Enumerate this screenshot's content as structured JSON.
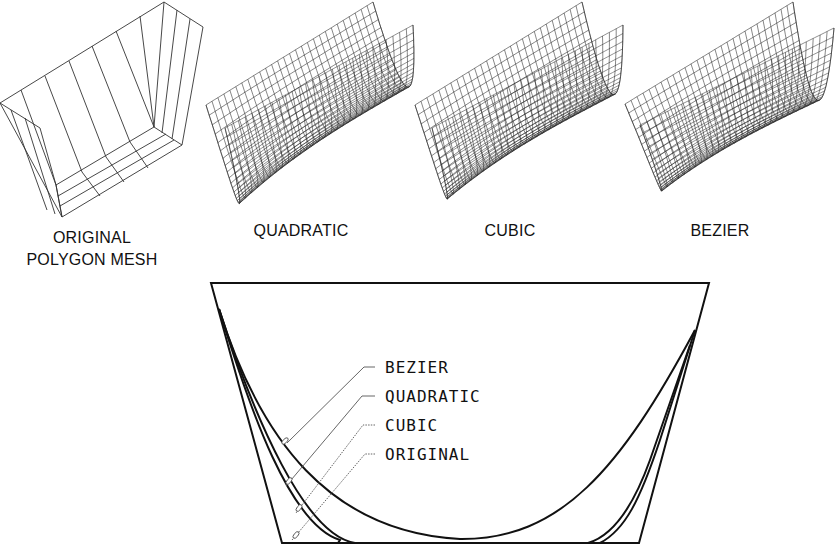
{
  "figure": {
    "meshes": [
      {
        "id": "original",
        "label_lines": [
          "ORIGINAL",
          "POLYGON MESH"
        ],
        "label_x": 92,
        "label_y": 243,
        "label_dy": 22
      },
      {
        "id": "quadratic",
        "label_lines": [
          "QUADRATIC"
        ],
        "label_x": 301,
        "label_y": 236
      },
      {
        "id": "cubic",
        "label_lines": [
          "CUBIC"
        ],
        "label_x": 510,
        "label_y": 236
      },
      {
        "id": "bezier",
        "label_lines": [
          "BEZIER"
        ],
        "label_x": 720,
        "label_y": 236
      }
    ],
    "cross_section": {
      "outline": {
        "top_left": [
          211,
          283
        ],
        "top_right": [
          709,
          283
        ],
        "bottom_right": [
          639,
          543
        ],
        "bottom_left": [
          282,
          543
        ]
      },
      "labels": [
        {
          "text": "BEZIER",
          "x": 385,
          "y": 373,
          "leader_style": "solid"
        },
        {
          "text": "QUADRATIC",
          "x": 385,
          "y": 402,
          "leader_style": "solid"
        },
        {
          "text": "CUBIC",
          "x": 385,
          "y": 431,
          "leader_style": "dotted"
        },
        {
          "text": "ORIGINAL",
          "x": 385,
          "y": 460,
          "leader_style": "dotted"
        }
      ]
    },
    "colors": {
      "ink": "#111111",
      "leader": "#555555",
      "background": "#ffffff"
    }
  }
}
